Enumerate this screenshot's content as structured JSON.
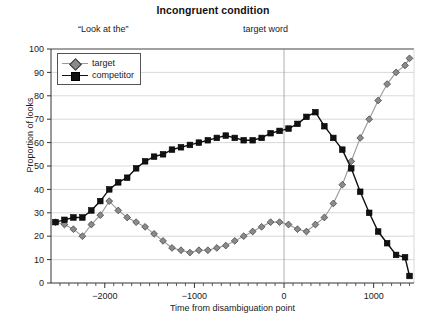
{
  "chart_data": {
    "type": "line",
    "title": "Incongruent condition",
    "xlabel": "Time from disambiguation point",
    "ylabel": "Proportion of looks",
    "xlim": [
      -2600,
      1450
    ],
    "ylim": [
      0,
      100
    ],
    "xticks": [
      -2000,
      -1000,
      0,
      1000
    ],
    "xtick_labels": [
      "−2000",
      "−1000",
      "0",
      "1000"
    ],
    "xminor_step": 100,
    "yticks": [
      0,
      10,
      20,
      30,
      40,
      50,
      60,
      70,
      80,
      90,
      100
    ],
    "ytick_labels": [
      "0",
      "10",
      "20",
      "30",
      "40",
      "50",
      "60",
      "70",
      "80",
      "90",
      "100"
    ],
    "grid": "horizontal",
    "legend_position": "upper-left",
    "annotations": [
      {
        "name": "look-at-the",
        "text": "“Look at the”",
        "x": -1900,
        "y": 103
      },
      {
        "name": "target-word",
        "text": "target word",
        "x": 70,
        "y": 103
      }
    ],
    "vlines": [
      {
        "x": 0,
        "color": "#999999"
      }
    ],
    "series": [
      {
        "name": "target",
        "marker": "diamond",
        "color": "#8a8a8a",
        "line_color": "#9a9a9a",
        "x": [
          -2550,
          -2450,
          -2350,
          -2250,
          -2150,
          -2050,
          -1950,
          -1850,
          -1750,
          -1650,
          -1550,
          -1450,
          -1350,
          -1250,
          -1150,
          -1050,
          -950,
          -850,
          -750,
          -650,
          -550,
          -450,
          -350,
          -250,
          -150,
          -50,
          50,
          150,
          250,
          350,
          450,
          550,
          650,
          750,
          850,
          950,
          1050,
          1150,
          1250,
          1350,
          1400
        ],
        "y": [
          26,
          25,
          23,
          20,
          25,
          29,
          35,
          31,
          28,
          26,
          24,
          21,
          18,
          15,
          14,
          13,
          14,
          14,
          15,
          16,
          18,
          20,
          22,
          24,
          26,
          26,
          25,
          23,
          22,
          25,
          28,
          34,
          42,
          52,
          62,
          70,
          78,
          85,
          90,
          93,
          96
        ]
      },
      {
        "name": "competitor",
        "marker": "square",
        "color": "#111111",
        "line_color": "#111111",
        "x": [
          -2550,
          -2450,
          -2350,
          -2250,
          -2150,
          -2050,
          -1950,
          -1850,
          -1750,
          -1650,
          -1550,
          -1450,
          -1350,
          -1250,
          -1150,
          -1050,
          -950,
          -850,
          -750,
          -650,
          -550,
          -450,
          -350,
          -250,
          -150,
          -50,
          50,
          150,
          250,
          350,
          450,
          550,
          650,
          750,
          850,
          950,
          1050,
          1150,
          1250,
          1350,
          1400
        ],
        "y": [
          26,
          27,
          28,
          28,
          31,
          35,
          40,
          43,
          45,
          49,
          52,
          54,
          55,
          57,
          58,
          59,
          60,
          61,
          62,
          63,
          62,
          61,
          61,
          62,
          64,
          65,
          66,
          68,
          71,
          73,
          67,
          62,
          57,
          49,
          39,
          30,
          22,
          17,
          12,
          11,
          3
        ]
      }
    ]
  }
}
